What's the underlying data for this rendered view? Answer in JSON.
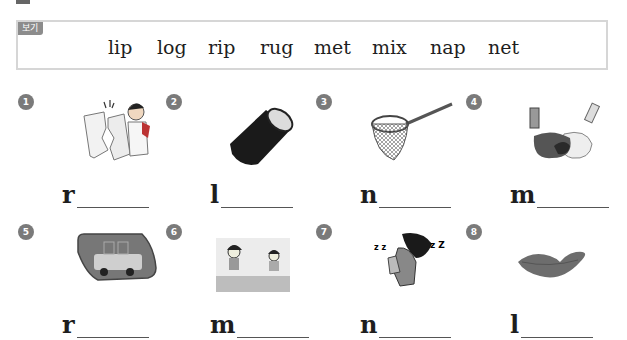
{
  "word_box": {
    "label": "보기",
    "words": [
      "lip",
      "log",
      "rip",
      "rug",
      "met",
      "mix",
      "nap",
      "net"
    ]
  },
  "items": [
    {
      "number": "1",
      "picture": "tearing-paper-icon",
      "first_letter": "r"
    },
    {
      "number": "2",
      "picture": "log-icon",
      "first_letter": "l"
    },
    {
      "number": "3",
      "picture": "butterfly-net-icon",
      "first_letter": "n"
    },
    {
      "number": "4",
      "picture": "paint-mix-icon",
      "first_letter": "m"
    },
    {
      "number": "5",
      "picture": "car-rug-icon",
      "first_letter": "r"
    },
    {
      "number": "6",
      "picture": "kids-meeting-icon",
      "first_letter": "m"
    },
    {
      "number": "7",
      "picture": "sleeping-kids-icon",
      "first_letter": "n"
    },
    {
      "number": "8",
      "picture": "lips-icon",
      "first_letter": "l"
    }
  ],
  "colors": {
    "badge": "#7a7a7a",
    "box_border": "#d6d6d6",
    "label_bg": "#8c8c8c"
  }
}
